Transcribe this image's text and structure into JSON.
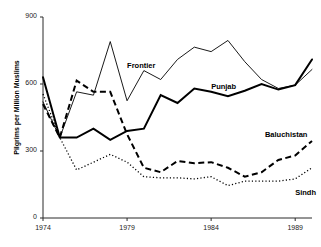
{
  "chart_data": {
    "type": "line",
    "title": "",
    "xlabel": "",
    "ylabel": "Pilgrims per Million Muslims",
    "xlim": [
      1974,
      1990
    ],
    "ylim": [
      0,
      900
    ],
    "yticks": [
      0,
      300,
      600,
      900
    ],
    "xticks": [
      1974,
      1979,
      1984,
      1989
    ],
    "grid": false,
    "legend_position": "inline-annotations",
    "x": [
      1974,
      1975,
      1976,
      1977,
      1978,
      1979,
      1980,
      1981,
      1982,
      1983,
      1984,
      1985,
      1986,
      1987,
      1988,
      1989,
      1990
    ],
    "series": [
      {
        "name": "Frontier",
        "style": "thin-solid",
        "color": "#000000",
        "values": [
          520,
          360,
          565,
          550,
          790,
          525,
          660,
          620,
          710,
          765,
          745,
          795,
          700,
          620,
          580,
          595,
          665
        ]
      },
      {
        "name": "Punjab",
        "style": "thick-solid",
        "color": "#000000",
        "values": [
          630,
          360,
          360,
          400,
          350,
          390,
          400,
          550,
          515,
          580,
          565,
          545,
          570,
          600,
          575,
          595,
          710
        ]
      },
      {
        "name": "Baluchistan",
        "style": "thick-dashed",
        "color": "#000000",
        "values": [
          510,
          360,
          615,
          565,
          565,
          375,
          225,
          205,
          255,
          245,
          250,
          225,
          185,
          205,
          260,
          280,
          345
        ]
      },
      {
        "name": "Sindh",
        "style": "dotted",
        "color": "#000000",
        "values": [
          555,
          360,
          215,
          250,
          285,
          250,
          185,
          180,
          180,
          175,
          185,
          145,
          165,
          165,
          165,
          175,
          225
        ]
      }
    ],
    "annotations": [
      {
        "text": "Frontier",
        "x": 1979,
        "y": 680
      },
      {
        "text": "Punjab",
        "x": 1984,
        "y": 585
      },
      {
        "text": "Baluchistan",
        "x": 1987.2,
        "y": 370
      },
      {
        "text": "Sindh",
        "x": 1989.0,
        "y": 110
      }
    ]
  }
}
